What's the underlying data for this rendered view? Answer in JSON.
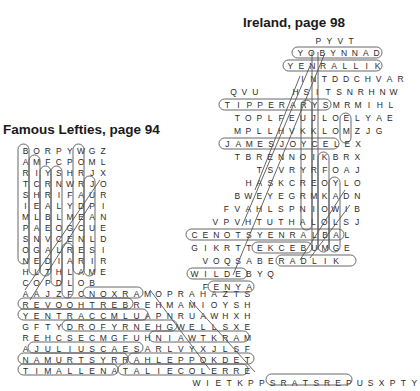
{
  "puzzles": [
    {
      "title": "Ireland, page 98",
      "rows": [
        {
          "x": 313,
          "y": 36,
          "letters": "PYVT"
        },
        {
          "x": 295,
          "y": 48,
          "letters": "YOBYNNAD"
        },
        {
          "x": 285,
          "y": 61,
          "letters": "YENRALLIK"
        },
        {
          "x": 297,
          "y": 74,
          "letters": "INTDDCHVAR"
        },
        {
          "x": 228,
          "y": 87,
          "letters": "QVU"
        },
        {
          "x": 290,
          "y": 87,
          "letters": "HSITSNRHNW"
        },
        {
          "x": 222,
          "y": 100,
          "letters": "TIPPERARYSMRMIHL"
        },
        {
          "x": 232,
          "y": 113,
          "letters": "TOPLFEUJLOELYAE"
        },
        {
          "x": 232,
          "y": 126,
          "letters": "MPLLHVKKLOMZJG"
        },
        {
          "x": 222,
          "y": 139,
          "letters": "JAMESJOYCELEX"
        },
        {
          "x": 232,
          "y": 152,
          "letters": "TBRENNOIKBRX"
        },
        {
          "x": 254,
          "y": 165,
          "letters": "TSVRYRFOAJ"
        },
        {
          "x": 243,
          "y": 178,
          "letters": "HASKCREOYLO"
        },
        {
          "x": 232,
          "y": 191,
          "letters": "BWEYEGRMKADN"
        },
        {
          "x": 221,
          "y": 204,
          "letters": "FVAHLSPNIOWIB"
        },
        {
          "x": 210,
          "y": 217,
          "letters": "VPVHTUTHALOLSJ"
        },
        {
          "x": 189,
          "y": 230,
          "letters": "CENOTSYENRALBAL"
        },
        {
          "x": 189,
          "y": 243,
          "letters": "GIKRTTEKCEBUMGE"
        },
        {
          "x": 200,
          "y": 256,
          "letters": "VOQSABERADLIK"
        },
        {
          "x": 189,
          "y": 269,
          "letters": "WILDEBYQ"
        },
        {
          "x": 200,
          "y": 282,
          "letters": "FENYA"
        }
      ]
    },
    {
      "title": "Famous Lefties, page 94",
      "rows": [
        {
          "x": 20,
          "y": 146,
          "letters": "BORPYWGZ"
        },
        {
          "x": 20,
          "y": 157,
          "letters": "AMFCPOML"
        },
        {
          "x": 20,
          "y": 168,
          "letters": "RIYSHRJX"
        },
        {
          "x": 20,
          "y": 179,
          "letters": "TCRNWRJO"
        },
        {
          "x": 20,
          "y": 190,
          "letters": "SHRIFAUR"
        },
        {
          "x": 20,
          "y": 201,
          "letters": "IEALYDPI"
        },
        {
          "x": 20,
          "y": 212,
          "letters": "MLBLMEAN"
        },
        {
          "x": 20,
          "y": 223,
          "letters": "PAEOGCUE"
        },
        {
          "x": 20,
          "y": 234,
          "letters": "SNVCENLD"
        },
        {
          "x": 20,
          "y": 245,
          "letters": "OGALRESI"
        },
        {
          "x": 20,
          "y": 256,
          "letters": "NEDIARIR"
        },
        {
          "x": 20,
          "y": 267,
          "letters": "HLTHLAME"
        },
        {
          "x": 20,
          "y": 278,
          "letters": "COPDLOB"
        },
        {
          "x": 20,
          "y": 289,
          "letters": "AAJZFCNOXRAMOPRAHAZTS"
        },
        {
          "x": 20,
          "y": 300,
          "letters": "REVOOHTREBREHMAMIOYSH"
        },
        {
          "x": 20,
          "y": 311,
          "letters": "YENTRACCMLUAPNRUAWHXH"
        },
        {
          "x": 20,
          "y": 322,
          "letters": "GFTYDROFYRNEHGWELLSXE"
        },
        {
          "x": 20,
          "y": 333,
          "letters": "REHCSECMGFUHNIAWTKRAM"
        },
        {
          "x": 20,
          "y": 344,
          "letters": "AJULIUSCAESARLVYXJLSF"
        },
        {
          "x": 20,
          "y": 355,
          "letters": "NAMURTSYRRAHLEPPOKDET"
        },
        {
          "x": 20,
          "y": 366,
          "letters": "TIMALLENATALIECOLERRE"
        }
      ]
    },
    {
      "title": "",
      "rows": [
        {
          "x": 191,
          "y": 378,
          "letters": "WIETKPPSRATSREPUSXPTY"
        }
      ]
    }
  ]
}
